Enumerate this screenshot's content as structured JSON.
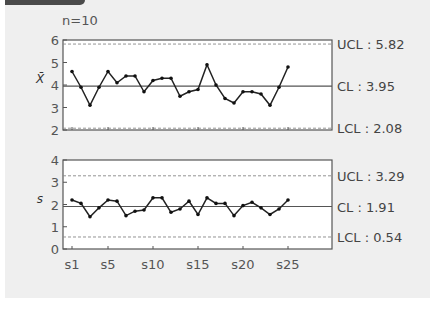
{
  "chart_data": [
    {
      "type": "line",
      "title": "X-bar chart",
      "subtitle": "n=10",
      "ylabel": "X̄",
      "xlabel": "",
      "ylim": [
        2,
        6
      ],
      "yticks": [
        "2",
        "3",
        "4",
        "5",
        "6"
      ],
      "categories": [
        "s1",
        "s2",
        "s3",
        "s4",
        "s5",
        "s6",
        "s7",
        "s8",
        "s9",
        "s10",
        "s11",
        "s12",
        "s13",
        "s14",
        "s15",
        "s16",
        "s17",
        "s18",
        "s19",
        "s20",
        "s21",
        "s22",
        "s23",
        "s24",
        "s25"
      ],
      "values": [
        4.6,
        3.9,
        3.1,
        3.9,
        4.6,
        4.1,
        4.4,
        4.4,
        3.7,
        4.2,
        4.3,
        4.3,
        3.5,
        3.7,
        3.8,
        4.9,
        4.0,
        3.4,
        3.2,
        3.7,
        3.7,
        3.6,
        3.1,
        3.9,
        4.8
      ],
      "limits": {
        "ucl": {
          "label": "UCL : 5.82",
          "value": 5.82
        },
        "cl": {
          "label": "CL : 3.95",
          "value": 3.95
        },
        "lcl": {
          "label": "LCL : 2.08",
          "value": 2.08
        }
      },
      "grid": false
    },
    {
      "type": "line",
      "title": "s chart",
      "ylabel": "s",
      "xlabel": "",
      "ylim": [
        0,
        4
      ],
      "yticks": [
        "0",
        "1",
        "2",
        "3",
        "4"
      ],
      "xtick_labels": [
        "s1",
        "s5",
        "s10",
        "s15",
        "s20",
        "s25"
      ],
      "categories": [
        "s1",
        "s2",
        "s3",
        "s4",
        "s5",
        "s6",
        "s7",
        "s8",
        "s9",
        "s10",
        "s11",
        "s12",
        "s13",
        "s14",
        "s15",
        "s16",
        "s17",
        "s18",
        "s19",
        "s20",
        "s21",
        "s22",
        "s23",
        "s24",
        "s25"
      ],
      "values": [
        2.2,
        2.05,
        1.45,
        1.85,
        2.2,
        2.15,
        1.5,
        1.7,
        1.75,
        2.3,
        2.3,
        1.65,
        1.8,
        2.15,
        1.55,
        2.3,
        2.05,
        2.05,
        1.5,
        1.95,
        2.1,
        1.85,
        1.55,
        1.8,
        2.2
      ],
      "limits": {
        "ucl": {
          "label": "UCL : 3.29",
          "value": 3.29
        },
        "cl": {
          "label": "CL : 1.91",
          "value": 1.91
        },
        "lcl": {
          "label": "LCL : 0.54",
          "value": 0.54
        }
      },
      "grid": false
    }
  ],
  "header": {
    "n_label": "n=10"
  }
}
